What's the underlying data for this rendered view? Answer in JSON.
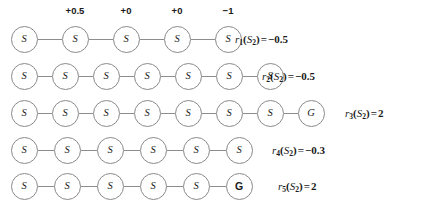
{
  "figure": {
    "type": "trajectory-rollouts",
    "node_radius_px": 13.5,
    "rewards_row_index": 0
  },
  "rewards": [
    {
      "label": "+0.5",
      "above_node_index": 1
    },
    {
      "label": "+0",
      "above_node_index": 2
    },
    {
      "label": "+0",
      "above_node_index": 3
    },
    {
      "label": "−1",
      "above_node_index": 4
    }
  ],
  "rows": [
    {
      "id": "row-1",
      "nodes": [
        {
          "base": "S",
          "sub": "2"
        },
        {
          "base": "S",
          "sub": "3"
        },
        {
          "base": "S",
          "sub": "7"
        },
        {
          "base": "S",
          "sub": "11"
        },
        {
          "base": "S",
          "sub": "12"
        }
      ],
      "result": {
        "fn": "r",
        "fn_sub": "1",
        "arg_base": "S",
        "arg_sub": "2",
        "eq": "=",
        "value": "−0.5"
      },
      "result_text": "r₁(S₂) = −0.5"
    },
    {
      "id": "row-2",
      "nodes": [
        {
          "base": "S",
          "sub": "2"
        },
        {
          "base": "S",
          "sub": "3"
        },
        {
          "base": "S",
          "sub": "2"
        },
        {
          "base": "S",
          "sub": "3"
        },
        {
          "base": "S",
          "sub": "7"
        },
        {
          "base": "S",
          "sub": "11"
        },
        {
          "base": "S",
          "sub": "12"
        }
      ],
      "result": {
        "fn": "r",
        "fn_sub": "2",
        "arg_base": "S",
        "arg_sub": "2",
        "eq": "=",
        "value": "−0.5"
      },
      "result_text": "r₂(S₂) = −0.5"
    },
    {
      "id": "row-3",
      "nodes": [
        {
          "base": "S",
          "sub": "2"
        },
        {
          "base": "S",
          "sub": "3"
        },
        {
          "base": "S",
          "sub": "7"
        },
        {
          "base": "S",
          "sub": "11"
        },
        {
          "base": "S",
          "sub": "7"
        },
        {
          "base": "S",
          "sub": "11"
        },
        {
          "base": "S",
          "sub": "15"
        },
        {
          "base": "G",
          "sub": "",
          "goal": true
        }
      ],
      "result": {
        "fn": "r",
        "fn_sub": "3",
        "arg_base": "S",
        "arg_sub": "2",
        "eq": "=",
        "value": "2"
      },
      "result_text": "r₃(S₂) = 2"
    },
    {
      "id": "row-4",
      "nodes": [
        {
          "base": "S",
          "sub": "2"
        },
        {
          "base": "S",
          "sub": "3"
        },
        {
          "base": "S",
          "sub": "4"
        },
        {
          "base": "S",
          "sub": "3"
        },
        {
          "base": "S",
          "sub": "7"
        },
        {
          "base": "S",
          "sub": "6"
        }
      ],
      "result": {
        "fn": "r",
        "fn_sub": "4",
        "arg_base": "S",
        "arg_sub": "2",
        "eq": "=",
        "value": "−0.3"
      },
      "result_text": "r₄(S₂) = −0.3"
    },
    {
      "id": "row-5",
      "nodes": [
        {
          "base": "S",
          "sub": "2"
        },
        {
          "base": "S",
          "sub": "3"
        },
        {
          "base": "S",
          "sub": "7"
        },
        {
          "base": "S",
          "sub": "11"
        },
        {
          "base": "S",
          "sub": "15"
        },
        {
          "base": "G",
          "sub": "",
          "goal_upright": true
        }
      ],
      "result": {
        "fn": "r",
        "fn_sub": "5",
        "arg_base": "S",
        "arg_sub": "2",
        "eq": "=",
        "value": "2"
      },
      "result_text": "r₅(S₂) = 2"
    }
  ],
  "colors": {
    "node_stroke": "#8a8a8a",
    "node_fill": "#ffffff",
    "edge": "#8d8d8d",
    "text": "#1a1a1a",
    "background": "#ffffff"
  }
}
